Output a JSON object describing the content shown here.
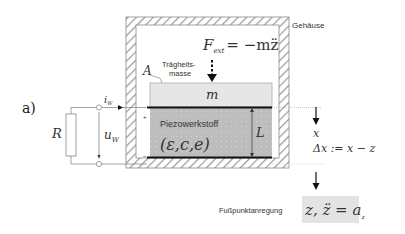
{
  "figure": {
    "panel_label": "a)",
    "housing_label": "Gehäuse",
    "force_equation": {
      "lhs": "F",
      "lhs_sub": "ext",
      "rhs": "= −mz̈"
    },
    "area_label": "A",
    "inertial_mass_label_line1": "Trägheits-",
    "inertial_mass_label_line2": "masse",
    "mass_label": "m",
    "piezo_material_label": "Piezowerkstoff",
    "piezo_params": "(ε,c,e)",
    "thickness_label": "L",
    "resistor_label": "R",
    "current_label": "i",
    "current_sub": "W",
    "voltage_label": "u",
    "voltage_sub": "W",
    "plus_sign": "+",
    "minus_sign": "−",
    "displacement_label": "x",
    "relative_displacement": "Δx := x − z",
    "base_excitation_label": "Fußpunktanregung",
    "base_excitation_eq_main": "z, z̈ = a",
    "base_excitation_eq_sub": "z"
  },
  "colors": {
    "hatch": "#9a9a9a",
    "mass_fill": "#e6e6e6",
    "piezo_fill": "#bdbdbd",
    "electrode": "#111111",
    "eq_box": "#e3e3e3",
    "wire": "#8a8a8a"
  }
}
